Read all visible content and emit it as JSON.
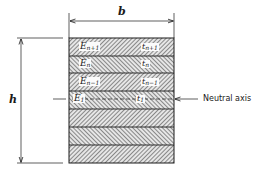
{
  "figure": {
    "dimensions": {
      "width_label": "b",
      "height_label": "h"
    },
    "neutral_axis_label": "Neutral axis",
    "layers": [
      {
        "E_base": "E",
        "E_sub": "n+1",
        "t_base": "t",
        "t_sub": "n+1",
        "hatch": "backslash"
      },
      {
        "E_base": "E",
        "E_sub": "n",
        "t_base": "t",
        "t_sub": "n",
        "hatch": "slash"
      },
      {
        "E_base": "E",
        "E_sub": "n−1",
        "t_base": "t",
        "t_sub": "n−1",
        "hatch": "backslash"
      },
      {
        "E_base": "E",
        "E_sub": "1",
        "t_base": "t",
        "t_sub": "1",
        "hatch": "slash"
      },
      {
        "E_base": "",
        "E_sub": "",
        "t_base": "",
        "t_sub": "",
        "hatch": "backslash"
      },
      {
        "E_base": "",
        "E_sub": "",
        "t_base": "",
        "t_sub": "",
        "hatch": "slash"
      },
      {
        "E_base": "",
        "E_sub": "",
        "t_base": "",
        "t_sub": "",
        "hatch": "backslash"
      }
    ],
    "colors": {
      "line": "#1a1a1a",
      "hatch": "#555555",
      "background": "#ffffff"
    }
  }
}
